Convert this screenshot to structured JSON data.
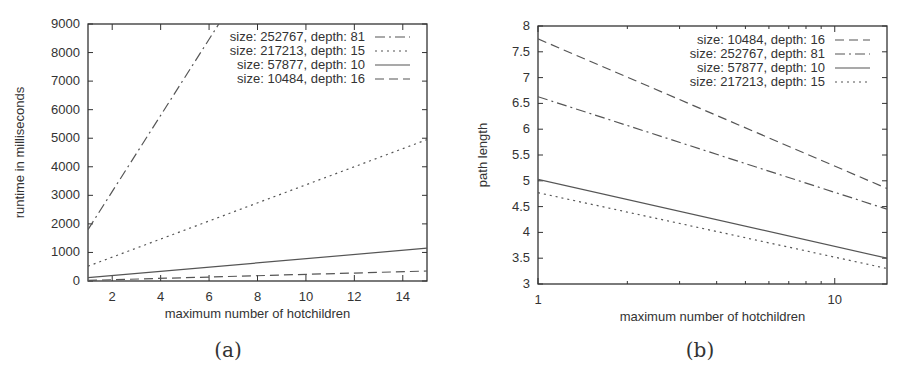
{
  "chart_data": [
    {
      "id": "a",
      "type": "line",
      "caption": "(a)",
      "title": "",
      "xlabel": "maximum number of hotchildren",
      "ylabel": "runtime in milliseconds",
      "xlim": [
        1,
        15
      ],
      "ylim": [
        0,
        9000
      ],
      "x_scale": "linear",
      "xticks": [
        2,
        4,
        6,
        8,
        10,
        12,
        14
      ],
      "yticks": [
        0,
        1000,
        2000,
        3000,
        4000,
        5000,
        6000,
        7000,
        8000,
        9000
      ],
      "grid": false,
      "legend_position": "top-right",
      "x": [
        1,
        15
      ],
      "series": [
        {
          "name": "size: 252767, depth: 81",
          "style": "dash-dot",
          "x": [
            1,
            6.4
          ],
          "values": [
            1800,
            9000
          ]
        },
        {
          "name": "size: 217213, depth: 15",
          "style": "dotted",
          "x": [
            1,
            15
          ],
          "values": [
            520,
            4950
          ]
        },
        {
          "name": "size: 57877, depth: 10",
          "style": "solid",
          "x": [
            1,
            15
          ],
          "values": [
            120,
            1150
          ]
        },
        {
          "name": "size: 10484, depth: 16",
          "style": "dashed",
          "x": [
            1,
            15
          ],
          "values": [
            20,
            350
          ]
        }
      ]
    },
    {
      "id": "b",
      "type": "line",
      "caption": "(b)",
      "title": "",
      "xlabel": "maximum number of hotchildren",
      "ylabel": "path length",
      "xlim": [
        1,
        15
      ],
      "ylim": [
        3,
        8
      ],
      "x_scale": "log",
      "xticks": [
        1,
        10
      ],
      "yticks": [
        3,
        3.5,
        4,
        4.5,
        5,
        5.5,
        6,
        6.5,
        7,
        7.5,
        8
      ],
      "grid": false,
      "legend_position": "top-right",
      "x": [
        1,
        15
      ],
      "series": [
        {
          "name": "size: 10484, depth: 16",
          "style": "dashed",
          "values": [
            7.75,
            4.85
          ]
        },
        {
          "name": "size: 252767, depth: 81",
          "style": "dash-dot",
          "values": [
            6.63,
            4.45
          ]
        },
        {
          "name": "size: 57877, depth: 10",
          "style": "solid",
          "values": [
            5.03,
            3.5
          ]
        },
        {
          "name": "size: 217213, depth: 15",
          "style": "dotted",
          "values": [
            4.77,
            3.3
          ]
        }
      ]
    }
  ]
}
